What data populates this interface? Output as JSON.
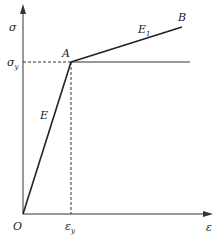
{
  "diagram": {
    "type": "bilinear stress-strain diagram",
    "axes": {
      "y_label": "σ",
      "x_label": "ε",
      "origin_label": "O"
    },
    "ticks": {
      "yield_stress": {
        "main": "σ",
        "sub": "y"
      },
      "yield_strain": {
        "main": "ε",
        "sub": "y"
      }
    },
    "points": {
      "A": "A",
      "B": "B"
    },
    "segments": {
      "elastic_modulus": "E",
      "hardening_modulus": {
        "main": "E",
        "sub": "1"
      }
    },
    "colors": {
      "line": "#222222",
      "axis": "#333333",
      "dashed": "#333333"
    }
  }
}
